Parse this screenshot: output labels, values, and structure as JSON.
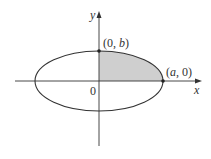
{
  "diagram": {
    "x_axis_label": "x",
    "y_axis_label": "y",
    "origin_label": "0",
    "point_top": {
      "prefix": "(0, ",
      "var": "b",
      "suffix": ")"
    },
    "point_right": {
      "prefix": "(",
      "var": "a",
      "suffix": ", 0)"
    },
    "shade_color": "#cfcfcf",
    "stroke_color": "#333333"
  }
}
